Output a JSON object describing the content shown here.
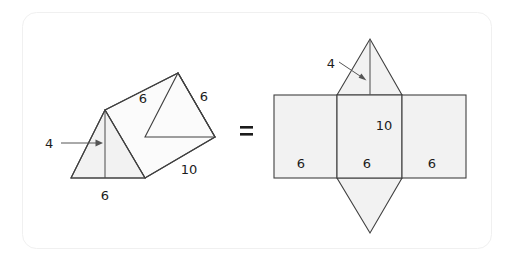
{
  "figure": {
    "equals_symbol": "=",
    "colors": {
      "face_fill": "#f2f2f2",
      "face_fill_light": "#fbfbfb",
      "stroke": "#404040",
      "hidden_edge": "#9a9a9a",
      "label_text": "#1c1c1c",
      "card_border": "#f0f0f0",
      "background": "#ffffff"
    },
    "prism": {
      "name": "triangular-prism",
      "labels": {
        "height": "4",
        "base": "6",
        "slant_top": "6",
        "slant_right": "6",
        "length": "10"
      }
    },
    "net": {
      "name": "prism-net",
      "labels": {
        "triangle_height": "4",
        "rect_left_width": "6",
        "rect_middle_width": "6",
        "rect_right_width": "6",
        "rect_height": "10"
      }
    }
  }
}
